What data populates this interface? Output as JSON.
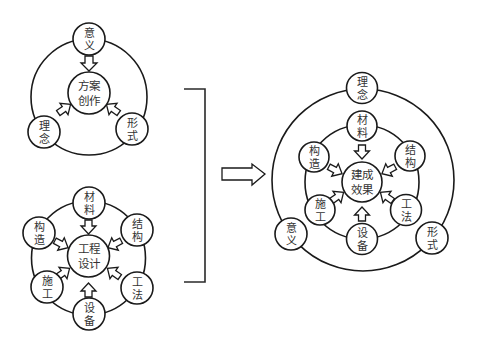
{
  "colors": {
    "stroke": "#1a1a1a",
    "text": "#333333",
    "background": "#ffffff"
  },
  "diagram_scheme": {
    "center": {
      "line1": "方案",
      "line2": "创作"
    },
    "nodes": [
      {
        "line1": "意",
        "line2": "义"
      },
      {
        "line1": "理",
        "line2": "念"
      },
      {
        "line1": "形",
        "line2": "式"
      }
    ]
  },
  "diagram_engineering": {
    "center": {
      "line1": "工程",
      "line2": "设计"
    },
    "nodes": [
      {
        "line1": "材",
        "line2": "料"
      },
      {
        "line1": "构",
        "line2": "造"
      },
      {
        "line1": "结",
        "line2": "构"
      },
      {
        "line1": "施",
        "line2": "工"
      },
      {
        "line1": "工",
        "line2": "法"
      },
      {
        "line1": "设",
        "line2": "备"
      }
    ]
  },
  "diagram_result": {
    "center": {
      "line1": "建成",
      "line2": "效果"
    },
    "outer_nodes": [
      {
        "line1": "理",
        "line2": "念"
      },
      {
        "line1": "意",
        "line2": "义"
      },
      {
        "line1": "形",
        "line2": "式"
      }
    ],
    "inner_nodes": [
      {
        "line1": "材",
        "line2": "料"
      },
      {
        "line1": "构",
        "line2": "造"
      },
      {
        "line1": "结",
        "line2": "构"
      },
      {
        "line1": "施",
        "line2": "工"
      },
      {
        "line1": "工",
        "line2": "法"
      },
      {
        "line1": "设",
        "line2": "备"
      }
    ]
  },
  "connector": {
    "bracket": "merge-bracket",
    "arrow": "right-hollow-arrow"
  }
}
